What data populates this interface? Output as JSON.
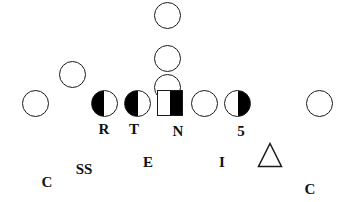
{
  "diagram": {
    "width": 345,
    "height": 202,
    "background_color": "#ffffff",
    "stroke_color": "#1a1a1a",
    "fill_color": "#000000",
    "markers": [
      {
        "id": "offense-deep-back",
        "name": "offense-circle-deep",
        "shape": "circle",
        "fill": "none",
        "x": 167,
        "y": 15,
        "size": 27
      },
      {
        "id": "offense-quarterback",
        "name": "offense-circle-quarterback",
        "shape": "circle",
        "fill": "none",
        "x": 167,
        "y": 58,
        "size": 27
      },
      {
        "id": "offense-fullback",
        "name": "offense-circle-fullback",
        "shape": "circle",
        "fill": "none",
        "x": 167,
        "y": 87,
        "size": 27
      },
      {
        "id": "offense-wing",
        "name": "offense-circle-wing",
        "shape": "circle",
        "fill": "none",
        "x": 72,
        "y": 74,
        "size": 27
      },
      {
        "id": "offense-split-end-left",
        "name": "offense-circle-split-end-left",
        "shape": "circle",
        "fill": "none",
        "x": 35,
        "y": 103,
        "size": 27
      },
      {
        "id": "defender-r",
        "name": "defender-half-circle-r",
        "shape": "circle",
        "fill": "left",
        "x": 104,
        "y": 103,
        "size": 27
      },
      {
        "id": "defender-t",
        "name": "defender-half-circle-t",
        "shape": "circle",
        "fill": "left",
        "x": 137,
        "y": 103,
        "size": 27
      },
      {
        "id": "defender-n",
        "name": "defender-half-square-n",
        "shape": "square",
        "fill": "right",
        "x": 170,
        "y": 103,
        "size": 26
      },
      {
        "id": "offense-guard-right",
        "name": "offense-circle-guard-right",
        "shape": "circle",
        "fill": "none",
        "x": 204,
        "y": 103,
        "size": 27
      },
      {
        "id": "defender-5",
        "name": "defender-half-circle-5",
        "shape": "circle",
        "fill": "right",
        "x": 237,
        "y": 103,
        "size": 27
      },
      {
        "id": "offense-split-end-right",
        "name": "offense-circle-split-end-right",
        "shape": "circle",
        "fill": "none",
        "x": 319,
        "y": 103,
        "size": 27
      },
      {
        "id": "offense-triangle",
        "name": "offense-triangle-marker",
        "shape": "triangle",
        "fill": "none",
        "x": 270,
        "y": 155,
        "size": 26
      }
    ],
    "position_labels": [
      {
        "id": "label-r",
        "name": "position-label-r",
        "text": "R",
        "x": 104,
        "y": 129
      },
      {
        "id": "label-t",
        "name": "position-label-t",
        "text": "T",
        "x": 134,
        "y": 129
      },
      {
        "id": "label-n",
        "name": "position-label-n",
        "text": "N",
        "x": 178,
        "y": 131
      },
      {
        "id": "label-5",
        "name": "position-label-5",
        "text": "5",
        "x": 241,
        "y": 131
      }
    ],
    "coverage_labels": [
      {
        "id": "label-c-left",
        "name": "coverage-label-cornerback-left",
        "text": "C",
        "x": 47,
        "y": 182
      },
      {
        "id": "label-ss",
        "name": "coverage-label-strong-safety",
        "text": "SS",
        "x": 84,
        "y": 169
      },
      {
        "id": "label-e",
        "name": "coverage-label-end",
        "text": "E",
        "x": 148,
        "y": 162
      },
      {
        "id": "label-i",
        "name": "coverage-label-inside-linebacker",
        "text": "I",
        "x": 222,
        "y": 162
      },
      {
        "id": "label-c-right",
        "name": "coverage-label-cornerback-right",
        "text": "C",
        "x": 310,
        "y": 189
      }
    ]
  }
}
